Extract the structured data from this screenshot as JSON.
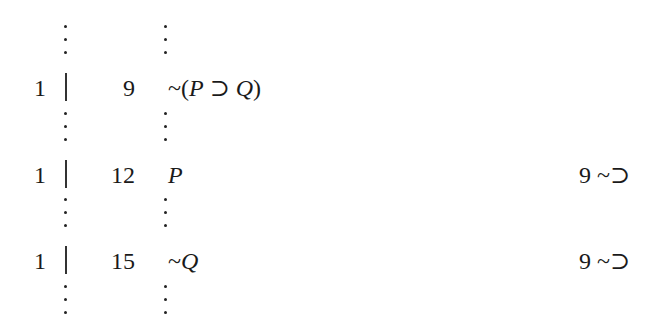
{
  "proof": {
    "rows": [
      {
        "dependency": "1",
        "line_number": "9",
        "formula_parts": [
          "~(",
          "P",
          " ⊃ ",
          "Q",
          ")"
        ],
        "formula": "~(P ⊃ Q)",
        "justification": ""
      },
      {
        "dependency": "1",
        "line_number": "12",
        "formula_parts": [
          "",
          "P",
          "",
          "",
          ""
        ],
        "formula": "P",
        "justification": "9 ~⊃"
      },
      {
        "dependency": "1",
        "line_number": "15",
        "formula_parts": [
          "~",
          "Q",
          "",
          "",
          ""
        ],
        "formula": "~Q",
        "justification": "9 ~⊃"
      }
    ],
    "ellipsis_symbol": "⋮"
  }
}
